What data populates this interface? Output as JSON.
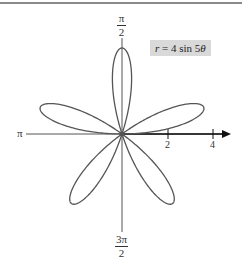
{
  "chart_data": {
    "type": "line",
    "subtype": "polar",
    "title": "",
    "equation": "r = 4 sin 5θ",
    "function": {
      "a": 4,
      "n": 5,
      "kind": "sin"
    },
    "petals": 5,
    "max_radius": 4,
    "radial_ticks": [
      2,
      4
    ],
    "angle_labels": {
      "pi_over_2": "π/2",
      "pi": "π",
      "three_pi_over_2": "3π/2"
    },
    "axis_arrow": "positive x-axis (polar axis)",
    "grid": false,
    "line_color": "#555555"
  },
  "labels": {
    "equation_r": "r",
    "equation_rest": " = 4 sin 5",
    "equation_theta": "θ",
    "top_num": "π",
    "top_den": "2",
    "left": "π",
    "bottom_num": "3π",
    "bottom_den": "2",
    "tick_2": "2",
    "tick_4": "4"
  }
}
